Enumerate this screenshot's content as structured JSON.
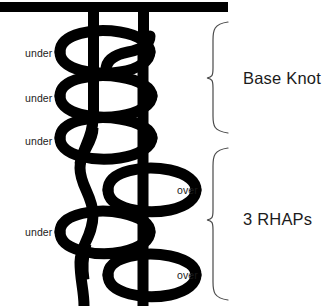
{
  "diagram": {
    "type": "knot-diagram",
    "colors": {
      "cord": "#000000",
      "background": "#ffffff",
      "text": "#1b1b1b",
      "bracket": "#4a4a4a"
    },
    "anchor_bar": {
      "name": "horizontal anchor bar",
      "x": 0,
      "y": 2,
      "width": 228,
      "height": 10
    },
    "strands": [
      {
        "name": "left-standing-strand",
        "x": 88,
        "width": 11
      },
      {
        "name": "right-working-strand",
        "x": 138,
        "width": 11
      }
    ]
  },
  "crossing_labels": [
    {
      "id": "under-1",
      "text": "under",
      "x": 25,
      "y": 48
    },
    {
      "id": "under-2",
      "text": "under",
      "x": 25,
      "y": 93
    },
    {
      "id": "under-3",
      "text": "under",
      "x": 25,
      "y": 136
    },
    {
      "id": "over-1",
      "text": "over",
      "x": 177,
      "y": 185
    },
    {
      "id": "under-4",
      "text": "under",
      "x": 25,
      "y": 227
    },
    {
      "id": "over-2",
      "text": "over",
      "x": 177,
      "y": 270
    }
  ],
  "groups": [
    {
      "id": "base-knot",
      "label": "Base Knot",
      "bracket": {
        "top": 22,
        "bottom": 133,
        "x": 212,
        "tip_y": 78
      },
      "label_x": 243,
      "label_y": 70
    },
    {
      "id": "three-rhaps",
      "label": "3 RHAPs",
      "bracket": {
        "top": 148,
        "bottom": 300,
        "x": 212,
        "tip_y": 220
      },
      "label_x": 243,
      "label_y": 211
    }
  ]
}
